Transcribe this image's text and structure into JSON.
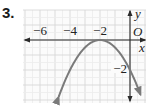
{
  "problem_number": "3.",
  "chart_data": {
    "type": "line",
    "title": "",
    "xlabel": "x",
    "ylabel": "y",
    "origin_label": "O",
    "x_tick_labels": [
      "−6",
      "−4",
      "−2"
    ],
    "x_ticks": [
      -6,
      -4,
      -2
    ],
    "y_tick_labels": [
      "−2"
    ],
    "y_ticks": [
      -2
    ],
    "xlim": [
      -7,
      1
    ],
    "ylim": [
      -4,
      2
    ],
    "grid": true,
    "unit": 1,
    "series": [
      {
        "name": "parabola",
        "equation": "y = -(1/2)(x + 2)^2",
        "vertex": [
          -2,
          0
        ],
        "x": [
          -5,
          -4,
          -3,
          -2,
          -1,
          0,
          1
        ],
        "values": [
          -4.5,
          -2,
          -0.5,
          0,
          -0.5,
          -2,
          -4.5
        ],
        "arrows_both_ends": true,
        "color": "#7a7a7a"
      }
    ],
    "colors": {
      "grid": "#d4d4d4",
      "axis": "#2a2a2a",
      "curve": "#7a7a7a",
      "background": "#ffffff"
    }
  }
}
